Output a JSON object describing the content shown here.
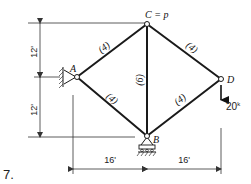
{
  "problem_number": "7.",
  "nodes": {
    "A": {
      "label": "A",
      "support": "pin (wall)"
    },
    "B": {
      "label": "B",
      "support": "roller"
    },
    "C": {
      "label": "C = p"
    },
    "D": {
      "label": "D"
    }
  },
  "members": [
    {
      "from": "A",
      "to": "C",
      "area_label": "(4)"
    },
    {
      "from": "A",
      "to": "B",
      "area_label": "(4)"
    },
    {
      "from": "C",
      "to": "B",
      "area_label": "(6)"
    },
    {
      "from": "C",
      "to": "D",
      "area_label": "(4)"
    },
    {
      "from": "B",
      "to": "D",
      "area_label": "(4)"
    }
  ],
  "load": {
    "node": "D",
    "direction": "down",
    "label": "20",
    "unit_superscript": "k"
  },
  "dimensions": {
    "vertical": [
      "12'",
      "12'"
    ],
    "horizontal": [
      "16'",
      "16'"
    ]
  }
}
